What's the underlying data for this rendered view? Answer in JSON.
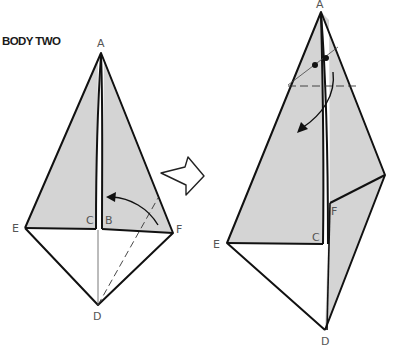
{
  "title": "BODY TWO",
  "colors": {
    "paper_shade": "#d4d4d4",
    "stroke": "#111111",
    "label": "#555555",
    "background": "#ffffff"
  },
  "left_figure": {
    "labels": {
      "A": "A",
      "B": "B",
      "C": "C",
      "D": "D",
      "E": "E",
      "F": "F"
    },
    "annotations": [
      "valley-fold-dashed-line-F-to-D",
      "curved-arrow-fold-F-toward-center",
      "crease-line-center-to-D"
    ]
  },
  "transition_arrow": "hollow-arrow-right",
  "right_figure": {
    "labels": {
      "A": "A",
      "C": "C",
      "D": "D",
      "E": "E",
      "F": "F"
    },
    "annotations": [
      "dashed-horizontal-fold-line",
      "two-dot-markers",
      "curved-arrow-fold-down"
    ]
  }
}
